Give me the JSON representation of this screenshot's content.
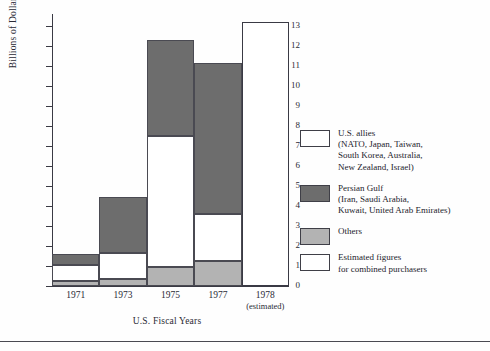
{
  "chart_data": {
    "type": "bar",
    "title": "",
    "xlabel": "U.S. Fiscal Years",
    "ylabel": "Billions of Dollars",
    "categories": [
      "1971",
      "1973",
      "1975",
      "1977",
      "1978"
    ],
    "category_sublabels": [
      "",
      "",
      "",
      "",
      "(estimated)"
    ],
    "ylim": [
      0,
      13.6
    ],
    "yticks": [
      0,
      1,
      2,
      3,
      4,
      5,
      6,
      7,
      8,
      9,
      10,
      11,
      12,
      13
    ],
    "ytick_labels": [
      "0",
      "1",
      "2",
      "3",
      "4",
      "5",
      "6",
      "7",
      "8",
      "9",
      "10",
      "11",
      "12",
      "13"
    ],
    "grid": false,
    "stacked": true,
    "stack_order_bottom_to_top": [
      "Others",
      "U.S. allies",
      "Persian Gulf"
    ],
    "series": [
      {
        "name": "Others",
        "color": "#b3b3b3",
        "values": [
          0.25,
          0.35,
          0.95,
          1.25,
          null
        ]
      },
      {
        "name": "U.S. allies",
        "color": "#ffffff",
        "values": [
          0.8,
          1.3,
          6.55,
          2.35,
          null
        ]
      },
      {
        "name": "Persian Gulf",
        "color": "#6d6d6d",
        "values": [
          0.55,
          2.8,
          4.8,
          7.55,
          null
        ]
      },
      {
        "name": "Estimated figures for combined purchasers",
        "color": "#ffffff",
        "values": [
          null,
          null,
          null,
          null,
          13.2
        ]
      }
    ],
    "totals": [
      1.6,
      4.45,
      12.3,
      11.15,
      13.2
    ],
    "legend_position": "right",
    "legend": [
      {
        "swatch": "allies",
        "lines": [
          "U.S. allies",
          "(NATO, Japan, Taiwan,",
          "South Korea, Australia,",
          "New Zealand, Israel)"
        ]
      },
      {
        "swatch": "gulf",
        "lines": [
          "Persian Gulf",
          "(Iran, Saudi Arabia,",
          "Kuwait, United Arab Emirates)"
        ]
      },
      {
        "swatch": "others",
        "lines": [
          "Others"
        ]
      },
      {
        "swatch": "est",
        "lines": [
          "Estimated figures",
          "for combined purchasers"
        ]
      }
    ]
  }
}
